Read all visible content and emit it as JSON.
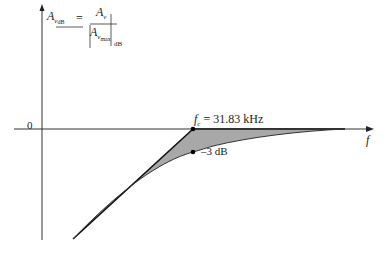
{
  "diagram": {
    "type": "frequency-response-asymptote",
    "y_axis_label": {
      "lhs": "A",
      "lhs_sub": "v",
      "lhs_sub2": "dB",
      "equals": "=",
      "num": "A",
      "num_sub": "v",
      "den": "A",
      "den_sub": "v",
      "den_sub2": "max",
      "eval_sub": "dB"
    },
    "x_axis_label": "f",
    "origin_label": "0",
    "corner_label_symbol": "f",
    "corner_label_sub": "c",
    "corner_label_value": "= 31.83 kHz",
    "minus3db_label": "–3 dB",
    "colors": {
      "axis": "#333333",
      "fill": "#a8a8a8",
      "line": "#111111"
    }
  }
}
